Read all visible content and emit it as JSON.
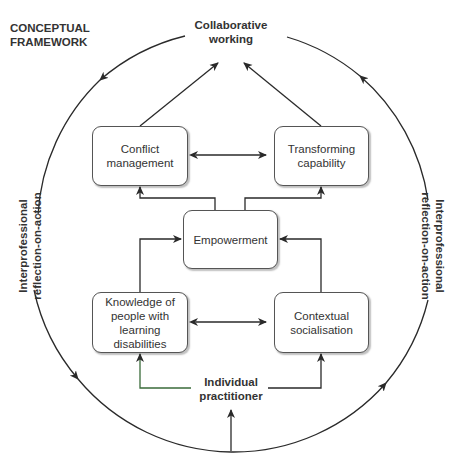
{
  "title": {
    "line1": "CONCEPTUAL",
    "line2": "FRAMEWORK"
  },
  "top_node": {
    "line1": "Collaborative",
    "line2": "working"
  },
  "bottom_node": {
    "line1": "Individual",
    "line2": "practitioner"
  },
  "side_labels": {
    "left": {
      "line1": "Interprofessional",
      "line2": "reflection-on-action"
    },
    "right": {
      "line1": "Interprofessional",
      "line2": "reflection-on-action"
    }
  },
  "boxes": {
    "conflict": {
      "line1": "Conflict",
      "line2": "management"
    },
    "transforming": {
      "line1": "Transforming",
      "line2": "capability"
    },
    "empowerment": {
      "line1": "Empowerment"
    },
    "knowledge": {
      "line1": "Knowledge of",
      "line2": "people with",
      "line3": "learning",
      "line4": "disabilities"
    },
    "contextual": {
      "line1": "Contextual",
      "line2": "socialisation"
    }
  },
  "colors": {
    "line": "#2a2a2a",
    "box_border": "#555555",
    "accent_line": "#3a6b3a"
  }
}
